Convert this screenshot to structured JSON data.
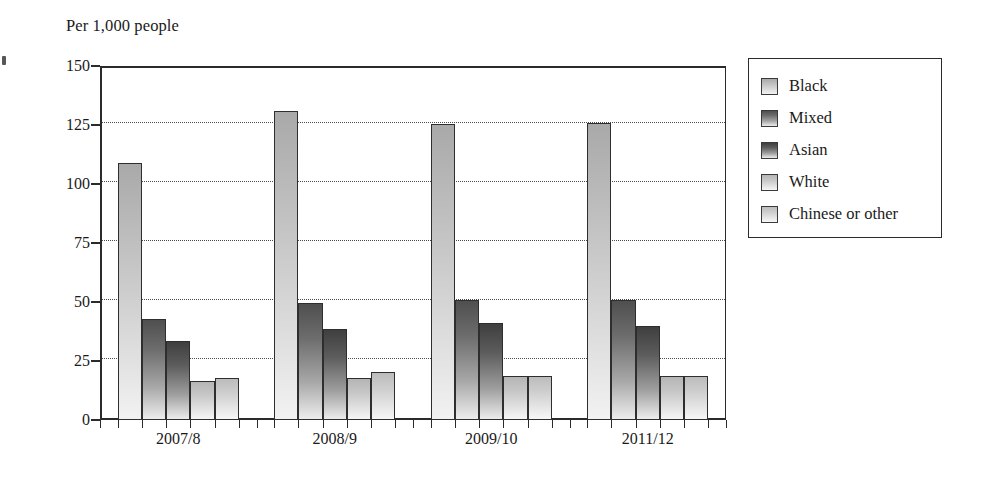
{
  "figure": {
    "y_axis_title": "Per 1,000 people"
  },
  "legend": {
    "items": [
      {
        "label": "Black",
        "swatch": "legend-swatch-black"
      },
      {
        "label": "Mixed",
        "swatch": "legend-swatch-mixed"
      },
      {
        "label": "Asian",
        "swatch": "legend-swatch-asian"
      },
      {
        "label": "White",
        "swatch": "legend-swatch-white"
      },
      {
        "label": "Chinese or other",
        "swatch": "legend-swatch-chinese"
      }
    ]
  },
  "chart_data": {
    "type": "bar",
    "title": "",
    "subtitle": "",
    "xlabel": "",
    "ylabel": "Per 1,000 people",
    "categories": [
      "2007/8",
      "2008/9",
      "2009/10",
      "2011/12"
    ],
    "series": [
      {
        "name": "Black",
        "values": [
          109,
          131,
          125.5,
          126
        ]
      },
      {
        "name": "Mixed",
        "values": [
          43,
          49.5,
          51,
          51
        ]
      },
      {
        "name": "Asian",
        "values": [
          33.5,
          38.5,
          41,
          40
        ]
      },
      {
        "name": "White",
        "values": [
          16.5,
          18,
          18.5,
          18.5
        ]
      },
      {
        "name": "Chinese or other",
        "values": [
          18,
          20.5,
          18.5,
          18.5
        ]
      }
    ],
    "ylim": [
      0,
      150
    ],
    "yticks": [
      0,
      25,
      50,
      75,
      100,
      125,
      150
    ],
    "ytick_labels": [
      "0",
      "25",
      "50",
      "75",
      "100",
      "125",
      "150"
    ],
    "grid": "horizontal-dotted",
    "legend_position": "right-outside",
    "colors": {
      "Black": "#c2c2c2",
      "Mixed": "#6d6d6d",
      "Asian": "#5c5c5c",
      "White": "#cfcfcf",
      "Chinese or other": "#d6d6d6",
      "axis": "#2b2b2b",
      "grid": "#4a4a4a",
      "background": "#ffffff"
    }
  }
}
